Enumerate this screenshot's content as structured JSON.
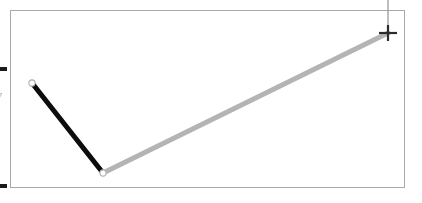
{
  "canvas": {
    "width": 422,
    "height": 203,
    "background": "#ffffff"
  },
  "plot": {
    "frame": {
      "x": 10,
      "y": 10,
      "width": 395,
      "height": 178,
      "border_color": "#a9a9a9",
      "fill": "#ffffff"
    },
    "y_axis_label": "y",
    "y_axis_label_color": "#9a9a9a",
    "ticks": [
      {
        "name": "upper",
        "y": 69,
        "color": "#1a1a1a"
      },
      {
        "name": "lower",
        "y": 186,
        "color": "#1a1a1a"
      }
    ],
    "cursor": {
      "type": "crosshair",
      "x": 388,
      "y": 33,
      "color": "#2b2b2b",
      "guide_color": "#9b9b9b",
      "guide_from_y": 0,
      "guide_to_y": 33
    }
  },
  "chart_data": {
    "type": "line",
    "title": "",
    "subtitle": "",
    "xlabel": "",
    "ylabel": "y",
    "grid": false,
    "legend": "none",
    "annotations": [
      {
        "name": "crosshair-cursor",
        "x": 388,
        "y": 33,
        "label": "+"
      }
    ],
    "series": [
      {
        "name": "segment-descending",
        "color": "#0d0d0d",
        "line_width": 5,
        "marker": "open-circle",
        "points": [
          {
            "x": 32,
            "y": 83
          },
          {
            "x": 103,
            "y": 173
          }
        ]
      },
      {
        "name": "segment-ascending",
        "color": "#b4b4b4",
        "line_width": 5,
        "marker": "open-circle",
        "points": [
          {
            "x": 103,
            "y": 173
          },
          {
            "x": 388,
            "y": 33
          }
        ]
      }
    ],
    "markers": [
      {
        "name": "vertex-start",
        "x": 32,
        "y": 83,
        "fill": "#ffffff",
        "stroke": "#b0b0b0"
      },
      {
        "name": "vertex-middle",
        "x": 103,
        "y": 173,
        "fill": "#ffffff",
        "stroke": "#b0b0b0"
      }
    ],
    "xlim": [
      10,
      405
    ],
    "ylim": [
      188,
      10
    ]
  }
}
